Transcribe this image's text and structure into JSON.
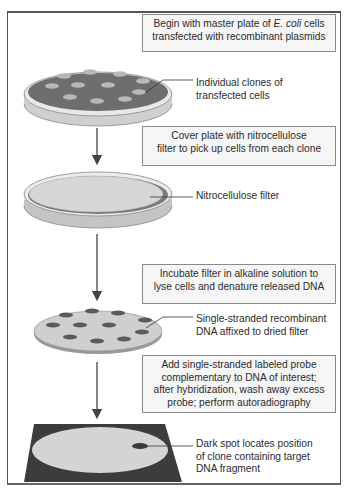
{
  "diagram": {
    "type": "flowchart",
    "direction": "top-to-bottom",
    "steps": [
      {
        "id": "step-1",
        "box_text_parts": [
          "Begin with master plate of ",
          "E. coli",
          " cells transfected with recombinant plasmids"
        ],
        "box_text": "Begin with master plate of E. coli cells transfected with recombinant plasmids",
        "illustration": "petri-dish-with-colonies",
        "callout": "Individual clones of transfected cells"
      },
      {
        "id": "step-2",
        "box_text": "Cover plate with nitrocellulose filter to pick up cells from each clone",
        "illustration": "petri-dish-covered-with-filter",
        "callout": "Nitrocellulose filter"
      },
      {
        "id": "step-3",
        "box_text": "Incubate filter in alkaline solution to lyse cells and denature released DNA",
        "illustration": "dried-filter-with-dna-spots",
        "callout": "Single-stranded recombinant DNA affixed to dried filter"
      },
      {
        "id": "step-4",
        "box_text": "Add single-stranded labeled probe complementary to DNA of interest; after hybridization, wash away excess probe; perform autoradiography",
        "illustration": "autoradiograph-film",
        "callout": "Dark spot locates position of clone containing target DNA fragment"
      }
    ],
    "text": {
      "box1_a": "Begin with master plate of ",
      "box1_italic": "E. coli",
      "box1_b": " cells",
      "box1_line2": "transfected with recombinant plasmids",
      "callout1_line1": "Individual clones of",
      "callout1_line2": "transfected cells",
      "box2_line1": "Cover plate with nitrocellulose",
      "box2_line2": "filter to pick up cells from each clone",
      "callout2": "Nitrocellulose filter",
      "box3_line1": "Incubate filter in alkaline solution to",
      "box3_line2": "lyse cells and denature released DNA",
      "callout3_line1": "Single-stranded recombinant",
      "callout3_line2": "DNA affixed to dried filter",
      "box4_line1": "Add single-stranded labeled probe",
      "box4_line2": "complementary to DNA of interest;",
      "box4_line3": "after hybridization, wash away excess",
      "box4_line4": "probe; perform autoradiography",
      "callout4_line1": "Dark spot locates position",
      "callout4_line2": "of clone containing target",
      "callout4_line3": "DNA fragment"
    },
    "colors": {
      "frame": "#555555",
      "box_border": "#8a8a8a",
      "box_fill": "#f6f6f6",
      "agar_dark": "#6e6e6e",
      "colony_light": "#b8b8b8",
      "filter_light": "#d6d6d6",
      "dna_spot": "#5a5a5a",
      "film_dark": "#3c3c3c",
      "arrow": "#444444"
    }
  }
}
